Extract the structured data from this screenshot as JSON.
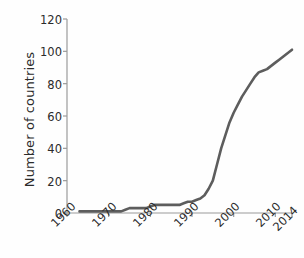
{
  "chart_data": {
    "type": "line",
    "title": "",
    "xlabel": "",
    "ylabel": "Number of countries",
    "xlim": [
      1960,
      2014
    ],
    "ylim": [
      0,
      120
    ],
    "grid": false,
    "legend": false,
    "line_color": "#5d5d5d",
    "axis_color": "#9a9a9a",
    "text_color": "#2b2b2b",
    "background_color": "#fefefe",
    "xticks": [
      1960,
      1970,
      1980,
      1990,
      2000,
      2010,
      2014
    ],
    "xticklabels": [
      "1960",
      "1970",
      "1980",
      "1990",
      "2000",
      "2010",
      "2014"
    ],
    "yticks": [
      0,
      20,
      40,
      60,
      80,
      100,
      120
    ],
    "yticklabels": [
      "0",
      "20",
      "40",
      "60",
      "80",
      "100",
      "120"
    ],
    "series": [
      {
        "name": "Cumulative number of countries",
        "x": [
          1963,
          1965,
          1967,
          1969,
          1970,
          1971,
          1972,
          1973,
          1974,
          1975,
          1976,
          1977,
          1978,
          1979,
          1980,
          1981,
          1982,
          1983,
          1984,
          1985,
          1986,
          1987,
          1988,
          1989,
          1990,
          1991,
          1992,
          1993,
          1994,
          1995,
          1996,
          1997,
          1998,
          1999,
          2000,
          2001,
          2002,
          2003,
          2004,
          2005,
          2006,
          2007,
          2008,
          2009,
          2010,
          2011,
          2012,
          2013,
          2014
        ],
        "y": [
          1,
          1,
          1,
          1,
          1,
          1,
          1,
          1,
          2,
          3,
          3,
          3,
          3,
          3,
          4,
          5,
          5,
          5,
          5,
          5,
          5,
          5,
          6,
          7,
          7,
          8,
          9,
          11,
          15,
          20,
          30,
          40,
          48,
          56,
          62,
          67,
          72,
          76,
          80,
          84,
          87,
          88,
          89,
          91,
          93,
          95,
          97,
          99,
          101
        ]
      }
    ]
  },
  "axes": {
    "y_axis_title": "Number of countries"
  }
}
